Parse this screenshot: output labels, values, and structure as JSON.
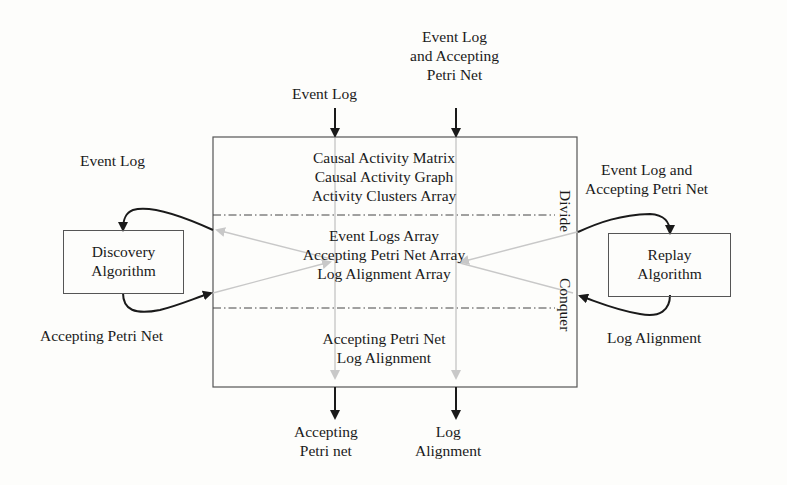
{
  "diagram": {
    "inputs_top": {
      "left": "Event Log",
      "right": [
        "Event Log",
        "and Accepting",
        "Petri Net"
      ]
    },
    "main_box": {
      "top_section": [
        "Causal Activity Matrix",
        "Causal Activity Graph",
        "Activity Clusters Array"
      ],
      "middle_section": [
        "Event Logs Array",
        "Accepting Petri Net Array",
        "Log Alignment Array"
      ],
      "bottom_section": [
        "Accepting Petri Net",
        "Log Alignment"
      ],
      "side_labels": {
        "divide": "Divide",
        "conquer": "Conquer"
      }
    },
    "discovery": {
      "box_label": [
        "Discovery",
        "Algorithm"
      ],
      "input_label": "Event Log",
      "output_label": "Accepting Petri Net"
    },
    "replay": {
      "box_label": [
        "Replay",
        "Algorithm"
      ],
      "input_label": [
        "Event Log and",
        "Accepting Petri Net"
      ],
      "output_label": "Log Alignment"
    },
    "outputs_bottom": {
      "left": [
        "Accepting",
        "Petri net"
      ],
      "right": [
        "Log",
        "Alignment"
      ]
    },
    "colors": {
      "arrow": "#1a1a1a",
      "inner_arrow": "#c8c8c8",
      "border": "#555555"
    }
  }
}
